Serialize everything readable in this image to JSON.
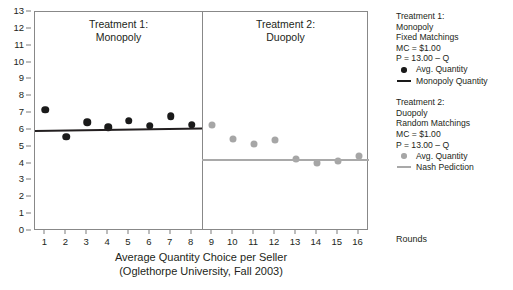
{
  "chart_data": {
    "type": "scatter",
    "title": "",
    "xlabel": "Average Quantity Choice per Seller",
    "xlabel_line2": "(Oglethorpe University, Fall 2003)",
    "ylabel": "",
    "xlim": [
      0.5,
      16.5
    ],
    "ylim": [
      0,
      13
    ],
    "grid": false,
    "legend_position": "right",
    "x_ticks": [
      "1",
      "2",
      "3",
      "4",
      "5",
      "6",
      "7",
      "8",
      "9",
      "10",
      "11",
      "12",
      "13",
      "14",
      "15",
      "16"
    ],
    "y_ticks": [
      "0",
      "1",
      "2",
      "3",
      "4",
      "5",
      "6",
      "7",
      "8",
      "9",
      "10",
      "11",
      "12",
      "13"
    ],
    "x": [
      1,
      2,
      3,
      4,
      5,
      6,
      7,
      8,
      9,
      10,
      11,
      12,
      13,
      14,
      15,
      16
    ],
    "panel_divider_x": 8.5,
    "series": [
      {
        "name": "Avg. Quantity",
        "treatment": "Treatment 1: Monopoly",
        "color": "#1a1a1a",
        "marker": "circle",
        "x": [
          1,
          2,
          3,
          4,
          5,
          6,
          7,
          8
        ],
        "values": [
          7.2,
          5.6,
          6.45,
          6.15,
          6.55,
          6.25,
          6.8,
          6.3
        ]
      },
      {
        "name": "Monopoly Quantity",
        "treatment": "Treatment 1: Monopoly",
        "color": "#1a1a1a",
        "marker": "line",
        "x": [
          0.5,
          8.5
        ],
        "values": [
          6.0,
          6.15
        ]
      },
      {
        "name": "Avg. Quantity",
        "treatment": "Treatment 2: Duopoly",
        "color": "#a6a6a6",
        "marker": "circle",
        "x": [
          9,
          10,
          11,
          12,
          13,
          14,
          15,
          16
        ],
        "values": [
          6.3,
          5.45,
          5.15,
          5.4,
          4.3,
          4.05,
          4.15,
          4.45
        ]
      },
      {
        "name": "Nash Pediction",
        "treatment": "Treatment 2: Duopoly",
        "color": "#a9a9a9",
        "marker": "line",
        "x": [
          8.5,
          16.5
        ],
        "values": [
          4.25,
          4.25
        ]
      }
    ]
  },
  "panels": {
    "left": {
      "title_line1": "Treatment 1:",
      "title_line2": "Monopoly"
    },
    "right": {
      "title_line1": "Treatment 2:",
      "title_line2": "Duopoly"
    }
  },
  "axis": {
    "x_title_line1": "Average Quantity Choice per Seller",
    "x_title_line2": "(Oglethorpe University, Fall 2003)",
    "rounds_label": "Rounds"
  },
  "legend": {
    "block1": {
      "line1": "Treatment 1:",
      "line2": "Monopoly",
      "line3": "Fixed Matchings",
      "line4": "MC = $1.00",
      "line5": "P = 13.00 – Q",
      "entry1": "Avg. Quantity",
      "entry2": "Monopoly Quantity"
    },
    "block2": {
      "line1": "Treatment 2:",
      "line2": "Duopoly",
      "line3": "Random Matchings",
      "line4": "MC = $1.00",
      "line5": "P = 13.00 – Q",
      "entry1": "Avg. Quantity",
      "entry2": "Nash Pediction"
    }
  },
  "colors": {
    "treatment1": "#1a1a1a",
    "treatment2": "#a6a6a6",
    "frame": "#888888",
    "text": "#231f20"
  }
}
